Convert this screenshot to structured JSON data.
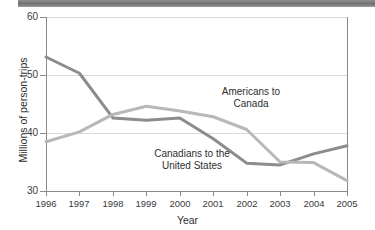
{
  "chart_data": {
    "type": "line",
    "title": "",
    "xlabel": "Year",
    "ylabel": "Millions of person-trips",
    "categories": [
      "1996",
      "1997",
      "1998",
      "1999",
      "2000",
      "2001",
      "2002",
      "2003",
      "2004",
      "2005"
    ],
    "x": [
      1996,
      1997,
      1998,
      1999,
      2000,
      2001,
      2002,
      2003,
      2004,
      2005
    ],
    "xlim": [
      1996,
      2005
    ],
    "ylim": [
      30,
      60
    ],
    "yticks": [
      30,
      40,
      50,
      60
    ],
    "grid": "horizontal",
    "legend": "inline-annotations",
    "series": [
      {
        "name": "Canadians to the United States",
        "color": "#8c8c8c",
        "values": [
          53.1,
          50.3,
          42.6,
          42.2,
          42.6,
          39.0,
          34.8,
          34.5,
          36.4,
          37.8
        ]
      },
      {
        "name": "Americans to Canada",
        "color": "#b8b8b8",
        "values": [
          38.5,
          40.2,
          43.2,
          44.6,
          43.8,
          42.8,
          40.6,
          35.0,
          34.9,
          31.8
        ]
      }
    ],
    "annotations": [
      {
        "id": "americans",
        "text": "Americans to\nCanada"
      },
      {
        "id": "canadians",
        "text": "Canadians to the\nUnited States"
      }
    ]
  },
  "axes": {
    "y_tick_labels": [
      "60",
      "50",
      "40",
      "30"
    ],
    "x_tick_labels": [
      "1996",
      "1997",
      "1998",
      "1999",
      "2000",
      "2001",
      "2002",
      "2003",
      "2004",
      "2005"
    ],
    "y_axis_title": "Millions of person-trips",
    "x_axis_title": "Year"
  },
  "colors": {
    "dark_series": "#8c8c8c",
    "light_series": "#b8b8b8",
    "grid": "#d9d9d9",
    "axis": "#8a8a8a",
    "text": "#2e2e2e",
    "topbar": "#7a7a7a"
  }
}
